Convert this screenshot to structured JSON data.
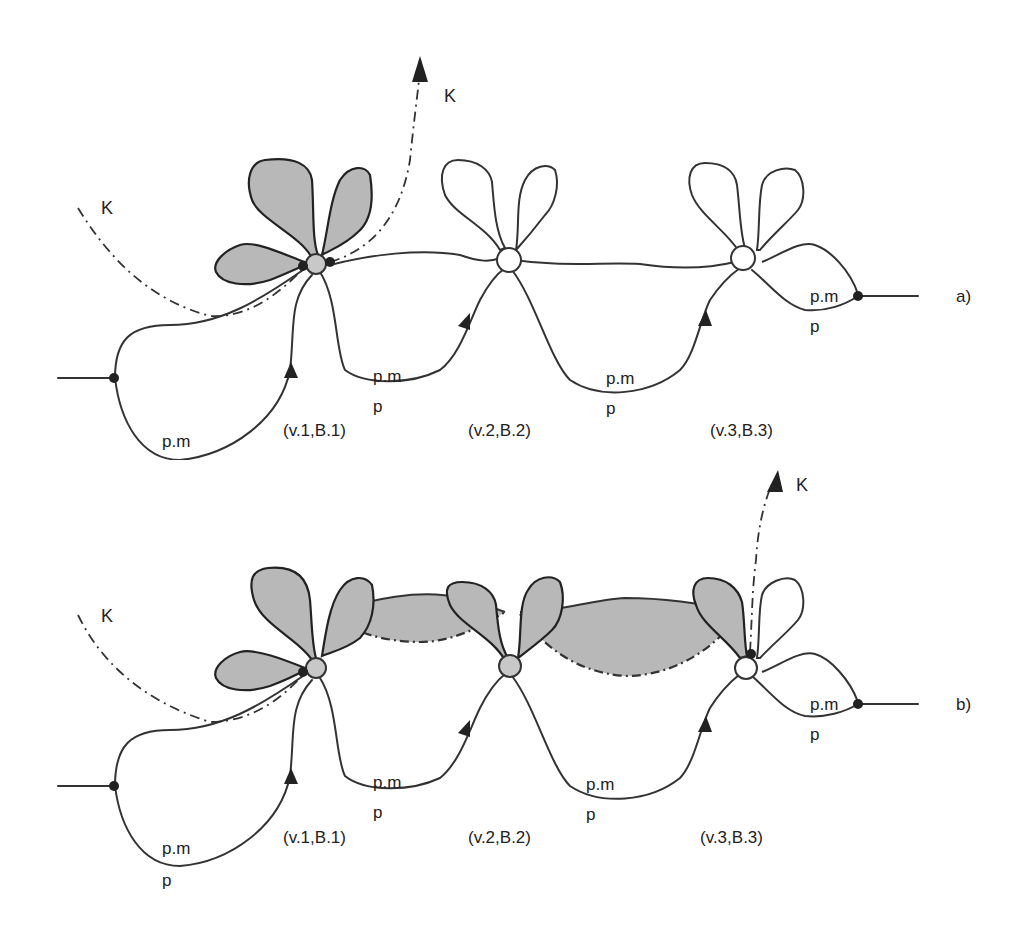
{
  "figure": {
    "panels": [
      {
        "id": "a",
        "panel_label": "a)",
        "k_labels": [
          "K",
          "K"
        ],
        "vertex_labels": [
          "(v.1,B.1)",
          "(v.2,B.2)",
          "(v.3,B.3)"
        ],
        "edge_labels": [
          {
            "top": "p.m",
            "bottom": "p"
          },
          {
            "top": "p.m",
            "bottom": "p"
          },
          {
            "top": "p.m",
            "bottom": "p"
          },
          {
            "top": "p.m",
            "bottom": "p"
          }
        ],
        "shaded_vertices": [
          "v.1"
        ]
      },
      {
        "id": "b",
        "panel_label": "b)",
        "k_labels": [
          "K",
          "K"
        ],
        "vertex_labels": [
          "(v.1,B.1)",
          "(v.2,B.2)",
          "(v.3,B.3)"
        ],
        "edge_labels": [
          {
            "top": "p.m",
            "bottom": "p"
          },
          {
            "top": "p.m",
            "bottom": "p"
          },
          {
            "top": "p.m",
            "bottom": "p"
          },
          {
            "top": "p.m",
            "bottom": "p"
          }
        ],
        "shaded_vertices": [
          "v.1",
          "v.2",
          "v.3-partial"
        ]
      }
    ],
    "colors": {
      "shade": "#b8b8b8",
      "stroke": "#333333",
      "background": "#ffffff"
    }
  }
}
